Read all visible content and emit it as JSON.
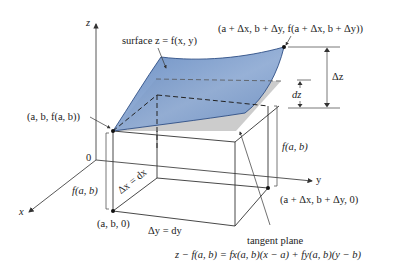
{
  "figure": {
    "axes": {
      "x_label": "x",
      "y_label": "y",
      "z_label": "z",
      "origin_label": "0"
    },
    "labels": {
      "surface": "surface z = f(x, y)",
      "point_top_left": "(a, b, f(a, b))",
      "point_top_right": "(a + Δx, b + Δy, f(a + Δx, b + Δy))",
      "point_base_left": "(a, b, 0)",
      "point_base_right": "(a + Δx, b + Δy, 0)",
      "height_left": "f(a, b)",
      "height_right": "f(a, b)",
      "delta_x": "Δx = dx",
      "delta_y": "Δy = dy",
      "delta_z": "Δz",
      "dz": "dz",
      "tangent_plane": "tangent plane",
      "tangent_equation": "z − f(a, b) = fx(a, b)(x − a) + fy(a, b)(y − b)"
    },
    "colors": {
      "surface_fill": "#7f9fcc",
      "surface_edge": "#2f4f86",
      "tangent_plane_fill": "#cfcfcf",
      "line": "#333333"
    }
  }
}
